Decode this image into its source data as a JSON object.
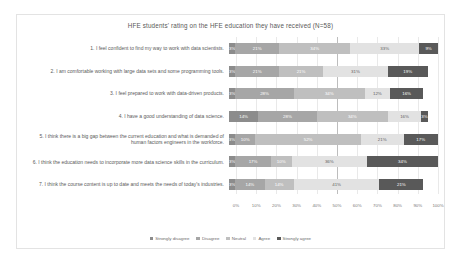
{
  "chart_data": {
    "type": "bar",
    "title": "HFE students' rating on the HFE education they have received (N=58)",
    "xlabel": "",
    "ylabel": "",
    "xlim": [
      0,
      100
    ],
    "grid": true,
    "legend_position": "bottom",
    "stacked": "100%",
    "orientation": "horizontal",
    "tick_labels": [
      "0%",
      "10%",
      "20%",
      "30%",
      "40%",
      "50%",
      "60%",
      "70%",
      "80%",
      "90%",
      "100%"
    ],
    "tick_values": [
      0,
      10,
      20,
      30,
      40,
      50,
      60,
      70,
      80,
      90,
      100
    ],
    "series": [
      {
        "name": "Strongly disagree",
        "color": "#8c8c8c",
        "values": [
          3,
          3,
          3,
          14,
          3,
          3,
          3
        ]
      },
      {
        "name": "Disagree",
        "color": "#a6a6a6",
        "values": [
          21,
          21,
          28,
          28,
          10,
          17,
          14
        ]
      },
      {
        "name": "Neutral",
        "color": "#bfbfbf",
        "values": [
          34,
          21,
          34,
          34,
          52,
          10,
          14
        ]
      },
      {
        "name": "Agree",
        "color": "#e2e2e2",
        "values": [
          33,
          31,
          12,
          16,
          21,
          36,
          41
        ]
      },
      {
        "name": "Strongly agree",
        "color": "#595959",
        "values": [
          9,
          19,
          16,
          3,
          17,
          34,
          21
        ]
      }
    ],
    "categories": [
      "1. I feel confident to find my way to work with data scientists.",
      "2. I am comfortable working with large data sets and some programming tools.",
      "3. I feel prepared to work with data-driven products.",
      "4. I have a good understanding of data science.",
      "5. I think there is a big gap between the current education and what is demanded of human factors engineers in the workforce.",
      "6. I think the education needs to incorporate more data science skills in the curriculum.",
      "7. I think the course content is up to date and meets the needs of today's industries."
    ],
    "bar_labels": [
      [
        "3%",
        "21%",
        "34%",
        "33%",
        "9%"
      ],
      [
        "3%",
        "21%",
        "21%",
        "31%",
        "19%"
      ],
      [
        "3%",
        "28%",
        "34%",
        "12%",
        "16%"
      ],
      [
        "14%",
        "28%",
        "34%",
        "16%",
        "3%"
      ],
      [
        "3%",
        "10%",
        "52%",
        "21%",
        "17%"
      ],
      [
        "3%",
        "17%",
        "10%",
        "36%",
        "34%"
      ],
      [
        "3%",
        "14%",
        "14%",
        "41%",
        "21%"
      ]
    ]
  }
}
